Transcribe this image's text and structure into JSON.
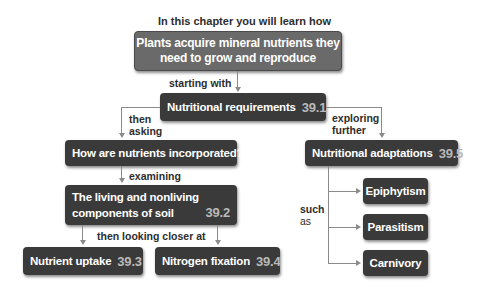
{
  "header": {
    "intro": "In this chapter you will learn how"
  },
  "main_box": {
    "line1": "Plants acquire mineral nutrients they",
    "line2": "need to grow and reproduce"
  },
  "connectors": {
    "starting_with": "starting with",
    "then_asking_1": "then",
    "then_asking_2": "asking",
    "exploring_1": "exploring",
    "exploring_2": "further",
    "examining": "examining",
    "then_looking": "then looking closer at",
    "such_1": "such",
    "such_2": "as"
  },
  "nodes": {
    "requirements": {
      "label": "Nutritional requirements",
      "section": "39.1"
    },
    "question": {
      "label": "How are nutrients incorporated?"
    },
    "soil": {
      "line1": "The living and nonliving",
      "line2": "components of soil",
      "section": "39.2"
    },
    "uptake": {
      "label": "Nutrient uptake",
      "section": "39.3"
    },
    "nitrogen": {
      "label": "Nitrogen fixation",
      "section": "39.4"
    },
    "adaptations": {
      "label": "Nutritional adaptations",
      "section": "39.5"
    },
    "examples": [
      {
        "label": "Epiphytism"
      },
      {
        "label": "Parasitism"
      },
      {
        "label": "Carnivory"
      }
    ]
  }
}
